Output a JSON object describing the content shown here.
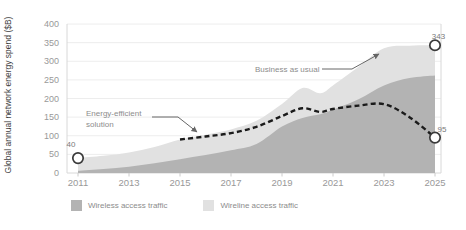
{
  "chart_data": {
    "type": "area",
    "title": "",
    "ylabel": "Global annual network energy spend ($B)",
    "xlabel": "",
    "ylim": [
      0,
      400
    ],
    "yticks": [
      0,
      50,
      100,
      150,
      200,
      250,
      300,
      350,
      400
    ],
    "xticks": [
      2011,
      2013,
      2015,
      2017,
      2019,
      2021,
      2023,
      2025
    ],
    "grid": "horizontal",
    "x": [
      2011,
      2012,
      2013,
      2014,
      2015,
      2016,
      2017,
      2018,
      2019,
      2019.8,
      2020.5,
      2021,
      2022,
      2023,
      2024,
      2025
    ],
    "series": [
      {
        "name": "Business as usual (total)",
        "kind": "area-top",
        "color": "#e1e1e1",
        "values": [
          40,
          46,
          55,
          70,
          90,
          103,
          117,
          140,
          185,
          228,
          214,
          235,
          285,
          335,
          342,
          343
        ]
      },
      {
        "name": "Wireless access traffic",
        "kind": "area",
        "color": "#b3b3b3",
        "values": [
          6,
          11,
          17,
          26,
          37,
          48,
          61,
          78,
          125,
          148,
          158,
          170,
          198,
          235,
          255,
          262
        ]
      },
      {
        "name": "Energy-efficient solution",
        "kind": "dashed-line",
        "color": "#1b1b1b",
        "x": [
          2015,
          2016,
          2017,
          2018,
          2019,
          2019.8,
          2020.5,
          2021,
          2022,
          2023,
          2024,
          2025
        ],
        "values": [
          90,
          98,
          107,
          124,
          153,
          174,
          164,
          172,
          181,
          185,
          150,
          95
        ]
      }
    ],
    "point_labels": [
      {
        "x": 2011,
        "value": 40,
        "label": "40",
        "label_pos": "above-left"
      },
      {
        "x": 2025,
        "value": 343,
        "label": "343",
        "label_pos": "above"
      },
      {
        "x": 2025,
        "value": 95,
        "label": "95",
        "label_pos": "right-above"
      }
    ],
    "annotations": [
      {
        "text": "Energy-efficient\nsolution",
        "target": "dashed-line"
      },
      {
        "text": "Business as usual",
        "target": "area-top"
      }
    ],
    "legend": [
      {
        "label": "Wireless access traffic",
        "color": "#b3b3b3"
      },
      {
        "label": "Wireline access traffic",
        "color": "#e1e1e1"
      }
    ],
    "colors": {
      "grid": "#ededed",
      "axis": "#d8d8d8",
      "tick_text": "#999999",
      "marker_stroke": "#3a3a3a",
      "arrow": "#666666"
    }
  }
}
